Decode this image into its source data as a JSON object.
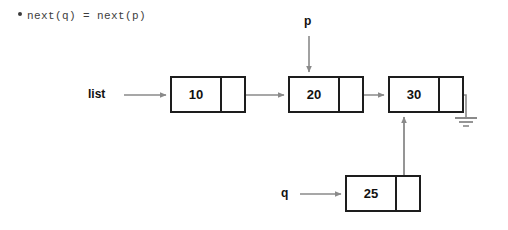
{
  "canvas": {
    "width": 508,
    "height": 230,
    "background": "#ffffff"
  },
  "colors": {
    "node_border": "#1d1d1d",
    "arrow": "#8a8a8a",
    "text": "#111111",
    "bullet_text": "#3d3d3d",
    "ground": "#8a8a8a"
  },
  "bullet": {
    "marker": "bullet-dot",
    "text": "next(q) = next(p)"
  },
  "diagram": {
    "nodes": [
      {
        "id": "node-10",
        "value": "10",
        "x": 170,
        "y": 76,
        "width": 76,
        "height": 37,
        "data_width": 50
      },
      {
        "id": "node-20",
        "value": "20",
        "x": 288,
        "y": 76,
        "width": 76,
        "height": 37,
        "data_width": 50
      },
      {
        "id": "node-30",
        "value": "30",
        "x": 388,
        "y": 76,
        "width": 76,
        "height": 37,
        "data_width": 50
      },
      {
        "id": "node-25",
        "value": "25",
        "x": 345,
        "y": 175,
        "width": 76,
        "height": 37,
        "data_width": 50
      }
    ],
    "pointers": [
      {
        "id": "list",
        "label": "list",
        "x": 88,
        "y": 87,
        "target": "node-10",
        "direction": "right"
      },
      {
        "id": "p",
        "label": "p",
        "x": 304,
        "y": 14,
        "target": "node-20",
        "direction": "down"
      },
      {
        "id": "q",
        "label": "q",
        "x": 281,
        "y": 186,
        "target": "node-25",
        "direction": "right"
      }
    ],
    "links": [
      {
        "from": "node-10",
        "to": "node-20",
        "kind": "next"
      },
      {
        "from": "node-20",
        "to": "node-30",
        "kind": "next"
      },
      {
        "from": "node-25",
        "to": "node-30",
        "kind": "next-up"
      },
      {
        "from": "node-30",
        "to": "ground",
        "kind": "null-ground"
      }
    ],
    "ground_symbol": {
      "id": "ground-symbol",
      "bars": 3
    }
  }
}
